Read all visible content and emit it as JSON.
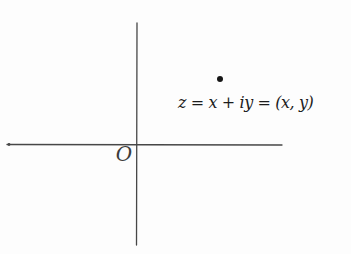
{
  "diagram": {
    "origin_label": "O",
    "point_label": "z = x + iy = (x, y)",
    "colors": {
      "background": "#fdfdfd",
      "axis": "#474747",
      "point": "#161616",
      "text": "#1c1c1c"
    }
  }
}
